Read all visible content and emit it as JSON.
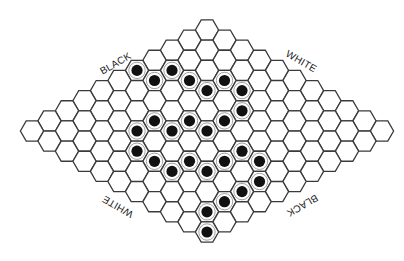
{
  "board": {
    "game": "Hex",
    "size": 11,
    "geometry": {
      "origin_x": 207,
      "origin_y": 30,
      "step_x": 17.5,
      "step_y": 10.1,
      "hex_radius": 11.6,
      "stone_radius": 5.6
    },
    "colors": {
      "background": "#ffffff",
      "grid_line": "#3a3a3a",
      "stone": "#111111"
    },
    "stones": [
      {
        "row": 4,
        "col": 0,
        "color": "black"
      },
      {
        "row": 3,
        "col": 1,
        "color": "black"
      },
      {
        "row": 4,
        "col": 1,
        "color": "black"
      },
      {
        "row": 3,
        "col": 2,
        "color": "black"
      },
      {
        "row": 3,
        "col": 3,
        "color": "black"
      },
      {
        "row": 2,
        "col": 3,
        "color": "black"
      },
      {
        "row": 2,
        "col": 4,
        "color": "black"
      },
      {
        "row": 3,
        "col": 5,
        "color": "black"
      },
      {
        "row": 6,
        "col": 3,
        "color": "black"
      },
      {
        "row": 5,
        "col": 4,
        "color": "black"
      },
      {
        "row": 4,
        "col": 5,
        "color": "black"
      },
      {
        "row": 7,
        "col": 3,
        "color": "black"
      },
      {
        "row": 6,
        "col": 4,
        "color": "black"
      },
      {
        "row": 5,
        "col": 5,
        "color": "black"
      },
      {
        "row": 8,
        "col": 4,
        "color": "black"
      },
      {
        "row": 5,
        "col": 7,
        "color": "black"
      },
      {
        "row": 8,
        "col": 5,
        "color": "black"
      },
      {
        "row": 7,
        "col": 6,
        "color": "black"
      },
      {
        "row": 6,
        "col": 7,
        "color": "black"
      },
      {
        "row": 5,
        "col": 8,
        "color": "black"
      },
      {
        "row": 8,
        "col": 6,
        "color": "black"
      },
      {
        "row": 7,
        "col": 7,
        "color": "black"
      },
      {
        "row": 6,
        "col": 9,
        "color": "black"
      },
      {
        "row": 7,
        "col": 9,
        "color": "black"
      },
      {
        "row": 8,
        "col": 9,
        "color": "black"
      },
      {
        "row": 9,
        "col": 9,
        "color": "black"
      },
      {
        "row": 10,
        "col": 10,
        "color": "black"
      }
    ]
  },
  "labels": {
    "top_left": {
      "text": "BLACK",
      "x": 116,
      "y": 64,
      "rotate": -30
    },
    "top_right": {
      "text": "WHITE",
      "x": 301,
      "y": 62,
      "rotate": 30
    },
    "bottom_left": {
      "text": "WHITE",
      "x": 118,
      "y": 206,
      "rotate": 210
    },
    "bottom_right": {
      "text": "BLACK",
      "x": 302,
      "y": 205,
      "rotate": 150
    }
  }
}
